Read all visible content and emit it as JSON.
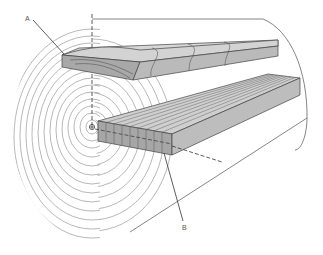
{
  "figure": {
    "labels": [
      {
        "id": "A",
        "text": "A",
        "meaning": "flat-sawn board (upper)"
      },
      {
        "id": "B",
        "text": "B",
        "meaning": "quarter-sawn board (lower)"
      }
    ],
    "colors": {
      "line": "#555555",
      "ring": "#777777",
      "board_top": "#cfcfcf",
      "board_front": "#a9a9a9",
      "board_side": "#bdbdbd",
      "background": "#ffffff"
    },
    "pith_center": [
      92,
      127
    ],
    "ring_count": 14
  }
}
